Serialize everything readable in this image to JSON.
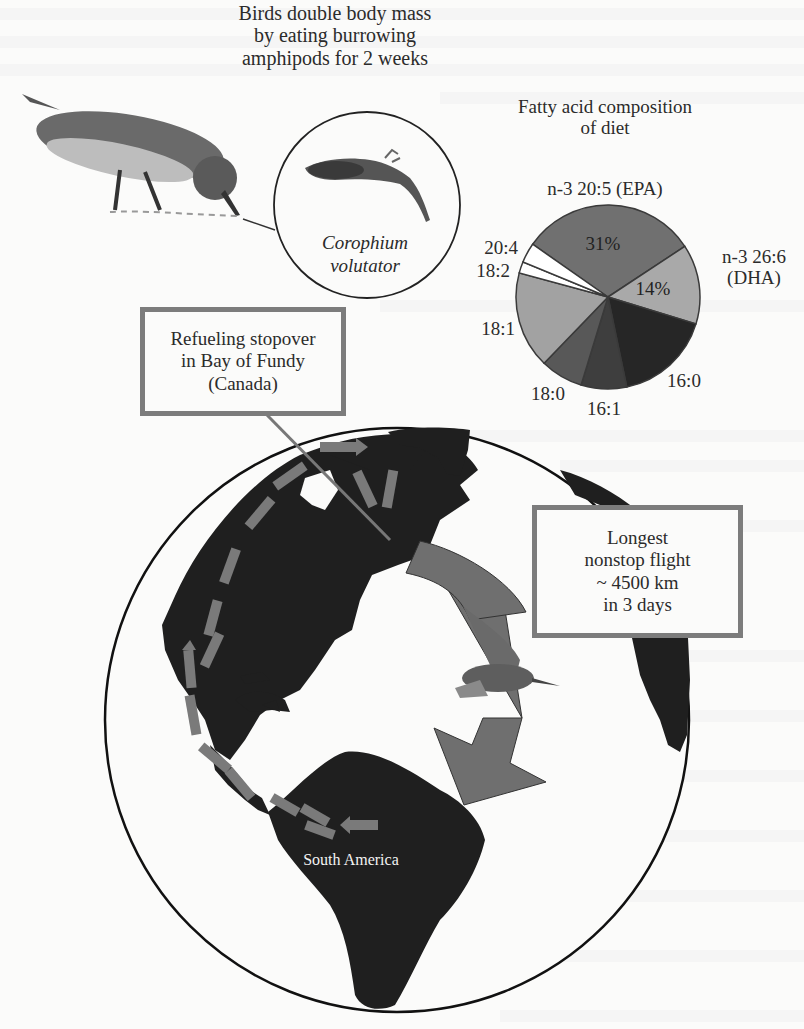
{
  "figure": {
    "title": "Birds double body mass\nby eating burrowing\namphipods for 2 weeks",
    "prey_species": "Corophium\nvolutator",
    "stopover_box": "Refueling stopover\nin Bay of Fundy\n(Canada)",
    "flight_box": "Longest\nnonstop flight\n~ 4500 km\nin 3 days",
    "continent_label": "South America",
    "icons": {
      "feeding_bird": "sandpiper-feeding-icon",
      "prey": "amphipod-icon",
      "flying_bird": "sandpiper-flying-icon",
      "globe": "globe-americas-icon",
      "migration_arrow": "migration-arrow-icon"
    },
    "colors": {
      "land": "#1e1e1e",
      "arrow": "#6f6f6f",
      "box_border": "#7c7c7c",
      "background": "#fbfbfa"
    }
  },
  "chart_data": {
    "type": "pie",
    "title": "Fatty acid composition\nof diet",
    "categories": [
      "n-3 20:5 (EPA)",
      "n-3 26:6 (DHA)",
      "16:0",
      "16:1",
      "18:0",
      "18:1",
      "18:2",
      "20:4"
    ],
    "values": [
      31,
      14,
      17,
      8,
      7.5,
      17,
      2,
      3.5
    ],
    "data_labels": {
      "n-3 20:5 (EPA)": "31%",
      "n-3 26:6 (DHA)": "14%"
    },
    "start_angle_deg": 305,
    "colors": [
      "#707070",
      "#a9a9a9",
      "#262626",
      "#3e3e3e",
      "#585858",
      "#a2a2a2",
      "#ffffff",
      "#ffffff"
    ],
    "labels": {
      "epa": "n-3 20:5 (EPA)",
      "dha": "n-3 26:6\n(DHA)",
      "c16_0": "16:0",
      "c16_1": "16:1",
      "c18_0": "18:0",
      "c18_1": "18:1",
      "c18_2": "18:2",
      "c20_4": "20:4",
      "pct_epa": "31%",
      "pct_dha": "14%"
    },
    "legend": "none (direct labels)"
  }
}
